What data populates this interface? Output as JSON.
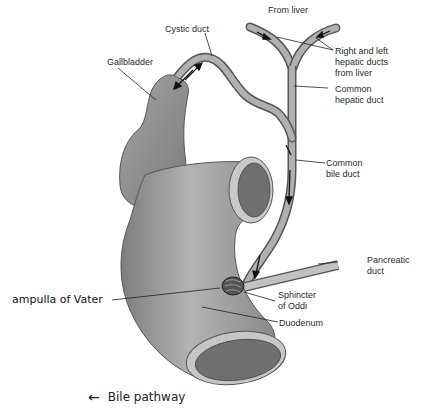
{
  "diagram": {
    "labels": {
      "from_liver": "From liver",
      "cystic_duct": "Cystic duct",
      "gallbladder": "Gallbladder",
      "hepatic_ducts": "Right and left\nhepatic ducts\nfrom liver",
      "common_hepatic": "Common\nhepatic duct",
      "common_bile": "Common\nbile duct",
      "pancreatic": "Pancreatic\nduct",
      "sphincter": "Sphincter\nof Oddi",
      "duodenum": "Duodenum",
      "ampulla": "ampulla of Vater"
    },
    "legend": {
      "arrow_icon": "←",
      "label": "Bile pathway"
    },
    "colors": {
      "organ_fill": "#9a9a9a",
      "organ_dark": "#6e6e6e",
      "duct_fill": "#a8a8a8",
      "outline": "#444444",
      "text": "#2a2a2a"
    }
  }
}
